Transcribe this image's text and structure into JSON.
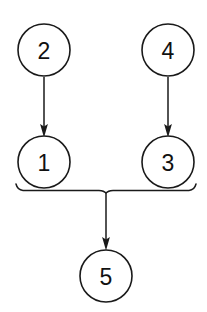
{
  "diagram": {
    "type": "node-link-diagram",
    "background_color": "#ffffff",
    "stroke_color": "#1a1a1a",
    "text_color": "#111111",
    "canvas": {
      "width": 207,
      "height": 312
    },
    "node_radius": 26,
    "nodes": [
      {
        "id": "2",
        "label": "2",
        "cx": 44,
        "cy": 50,
        "row": "top",
        "column": "left"
      },
      {
        "id": "4",
        "label": "4",
        "cx": 168,
        "cy": 50,
        "row": "top",
        "column": "right"
      },
      {
        "id": "1",
        "label": "1",
        "cx": 44,
        "cy": 162,
        "row": "middle",
        "column": "left"
      },
      {
        "id": "3",
        "label": "3",
        "cx": 168,
        "cy": 162,
        "row": "middle",
        "column": "right"
      },
      {
        "id": "5",
        "label": "5",
        "cx": 106,
        "cy": 276,
        "row": "bottom",
        "column": "center"
      }
    ],
    "edges": [
      {
        "from": "2",
        "to": "1",
        "kind": "arrow",
        "x": 44,
        "y1": 77,
        "y2": 136
      },
      {
        "from": "4",
        "to": "3",
        "kind": "arrow",
        "x": 168,
        "y1": 77,
        "y2": 136
      },
      {
        "from": "bracket",
        "to": "5",
        "kind": "arrow",
        "x": 106,
        "y1": 192,
        "y2": 249
      }
    ],
    "bracket": {
      "kind": "merge-bracket",
      "sources": [
        "1",
        "3"
      ],
      "target": "5",
      "y": 190,
      "x_left": 16,
      "x_right": 196,
      "x_center": 106,
      "hook_height": 6
    }
  }
}
